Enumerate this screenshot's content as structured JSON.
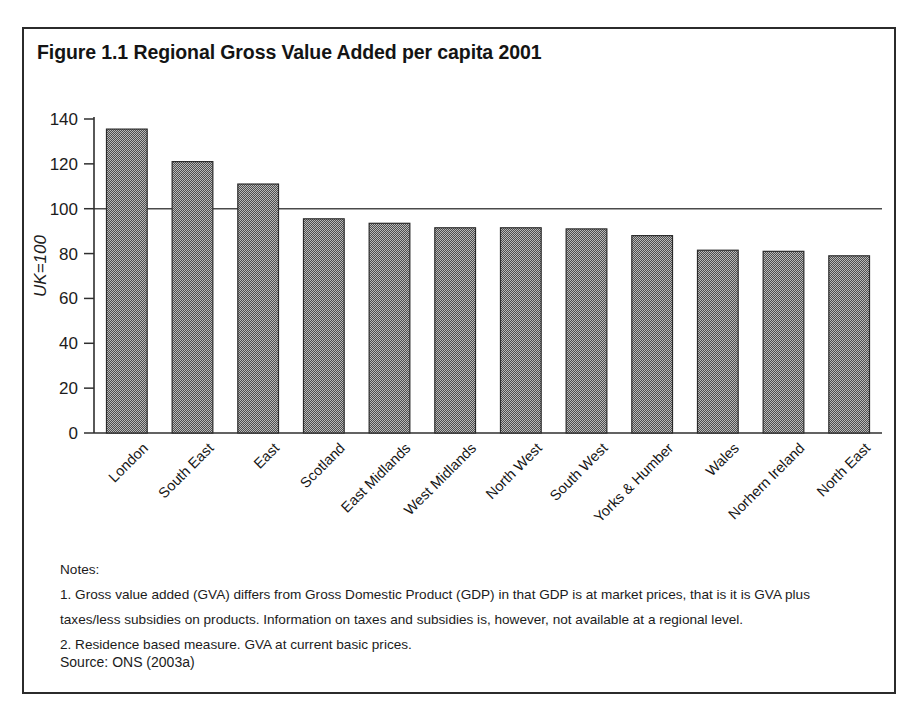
{
  "figure": {
    "title": "Figure 1.1 Regional Gross Value Added per capita 2001",
    "notes_heading": "Notes:",
    "notes": [
      "1. Gross value added (GVA) differs from Gross Domestic Product (GDP) in that GDP is at market prices, that is it is GVA plus",
      "taxes/less subsidies on products. Information on taxes and subsidies is, however, not available at a regional level.",
      "2. Residence based measure. GVA at current basic prices."
    ],
    "source": "Source: ONS (2003a)"
  },
  "chart_data": {
    "type": "bar",
    "title": "Figure 1.1 Regional Gross Value Added per capita 2001",
    "xlabel": "",
    "ylabel": "UK=100",
    "ylim": [
      0,
      140
    ],
    "yticks": [
      0,
      20,
      40,
      60,
      80,
      100,
      120,
      140
    ],
    "ytick_labels": [
      "0",
      "20",
      "40",
      "60",
      "80",
      "100",
      "120",
      "140"
    ],
    "grid": false,
    "reference_line": 100,
    "legend": null,
    "categories": [
      "London",
      "South East",
      "East",
      "Scotland",
      "East Midlands",
      "West Midlands",
      "North West",
      "South West",
      "Yorks & Humber",
      "Wales",
      "Norhern Ireland",
      "North East"
    ],
    "values": [
      135.5,
      121,
      111,
      95.5,
      93.5,
      91.5,
      91.5,
      91,
      88,
      81.5,
      81,
      79
    ],
    "bar_fill": "#7b7b7b",
    "bar_edge": "#2b2b2b"
  }
}
